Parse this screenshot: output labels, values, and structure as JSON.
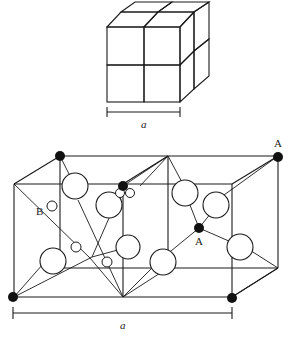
{
  "figure": {
    "top_diagram": {
      "description": "Cube divided into 2x2x2 sub-cubes with alternating hatched and white faces",
      "dimension_label": "a"
    },
    "bottom_diagram": {
      "description": "Unit cell showing two adjacent cubes with tetrahedral bonding; large open circles, small open circles, and solid black atoms",
      "labels": {
        "site_A_corner": "A",
        "site_A_inner": "A",
        "site_B": "B",
        "dimension": "a"
      }
    },
    "colors": {
      "line": "#1a1a1a",
      "solid_atom": "#111111",
      "background": "#ffffff"
    }
  }
}
